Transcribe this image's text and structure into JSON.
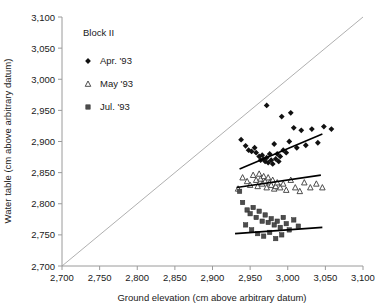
{
  "chart_data": {
    "type": "scatter",
    "title": "",
    "xlabel": "Ground elevation (cm above arbitrary datum)",
    "ylabel": "Water table (cm above arbitrary datum)",
    "xlim": [
      2700,
      3100
    ],
    "ylim": [
      2700,
      3100
    ],
    "xticks": [
      "2,700",
      "2,750",
      "2,800",
      "2,850",
      "2,900",
      "2,950",
      "3,000",
      "3,050",
      "3,100"
    ],
    "yticks": [
      "2,700",
      "2,750",
      "2,800",
      "2,850",
      "2,900",
      "2,950",
      "3,000",
      "3,050",
      "3,100"
    ],
    "xtick_values": [
      2700,
      2750,
      2800,
      2850,
      2900,
      2950,
      3000,
      3050,
      3100
    ],
    "ytick_values": [
      2700,
      2750,
      2800,
      2850,
      2900,
      2950,
      3000,
      3050,
      3100
    ],
    "grid": false,
    "legend_position": "upper-left-inside",
    "legend_title": "Block II",
    "reference_line": {
      "name": "1:1 line",
      "x": [
        2700,
        3100
      ],
      "y": [
        2700,
        3100
      ],
      "color": "#b0b0b0"
    },
    "series": [
      {
        "name": "Apr. '93",
        "marker": "diamond",
        "color": "#111111",
        "points": [
          [
            2938,
            2903
          ],
          [
            2944,
            2893
          ],
          [
            2948,
            2886
          ],
          [
            2952,
            2884
          ],
          [
            2956,
            2890
          ],
          [
            2958,
            2882
          ],
          [
            2962,
            2876
          ],
          [
            2964,
            2870
          ],
          [
            2966,
            2878
          ],
          [
            2968,
            2872
          ],
          [
            2970,
            2868
          ],
          [
            2972,
            2874
          ],
          [
            2974,
            2866
          ],
          [
            2976,
            2880
          ],
          [
            2978,
            2870
          ],
          [
            2980,
            2864
          ],
          [
            2982,
            2896
          ],
          [
            2984,
            2872
          ],
          [
            2986,
            2880
          ],
          [
            2988,
            2868
          ],
          [
            2990,
            2876
          ],
          [
            2992,
            2940
          ],
          [
            2994,
            2886
          ],
          [
            2998,
            2882
          ],
          [
            3002,
            2900
          ],
          [
            3008,
            2922
          ],
          [
            3012,
            2890
          ],
          [
            3018,
            2918
          ],
          [
            3024,
            2894
          ],
          [
            3032,
            2920
          ],
          [
            3040,
            2898
          ],
          [
            3048,
            2924
          ],
          [
            3058,
            2920
          ],
          [
            2972,
            2958
          ],
          [
            3004,
            2946
          ]
        ],
        "trend": {
          "x": [
            2936,
            3046
          ],
          "y": [
            2856,
            2912
          ]
        }
      },
      {
        "name": "May '93",
        "marker": "triangle",
        "color": "#3a3a3a",
        "points": [
          [
            2934,
            2824
          ],
          [
            2940,
            2842
          ],
          [
            2946,
            2836
          ],
          [
            2950,
            2830
          ],
          [
            2954,
            2846
          ],
          [
            2958,
            2838
          ],
          [
            2960,
            2828
          ],
          [
            2962,
            2848
          ],
          [
            2964,
            2840
          ],
          [
            2966,
            2832
          ],
          [
            2968,
            2844
          ],
          [
            2970,
            2836
          ],
          [
            2972,
            2826
          ],
          [
            2974,
            2842
          ],
          [
            2976,
            2834
          ],
          [
            2978,
            2830
          ],
          [
            2980,
            2838
          ],
          [
            2982,
            2824
          ],
          [
            2984,
            2828
          ],
          [
            2986,
            2834
          ],
          [
            2990,
            2826
          ],
          [
            2994,
            2832
          ],
          [
            2998,
            2822
          ],
          [
            3004,
            2838
          ],
          [
            3010,
            2826
          ],
          [
            3016,
            2820
          ],
          [
            3022,
            2834
          ],
          [
            3030,
            2826
          ],
          [
            3038,
            2832
          ],
          [
            3046,
            2826
          ]
        ],
        "trend": {
          "x": [
            2932,
            3044
          ],
          "y": [
            2826,
            2846
          ]
        }
      },
      {
        "name": "Jul. '93",
        "marker": "square",
        "color": "#4d4d4d",
        "points": [
          [
            2936,
            2820
          ],
          [
            2940,
            2802
          ],
          [
            2946,
            2790
          ],
          [
            2950,
            2784
          ],
          [
            2954,
            2794
          ],
          [
            2958,
            2778
          ],
          [
            2962,
            2788
          ],
          [
            2966,
            2772
          ],
          [
            2970,
            2782
          ],
          [
            2974,
            2770
          ],
          [
            2978,
            2776
          ],
          [
            2982,
            2766
          ],
          [
            2986,
            2772
          ],
          [
            2990,
            2762
          ],
          [
            2994,
            2778
          ],
          [
            2998,
            2768
          ],
          [
            3002,
            2758
          ],
          [
            3008,
            2774
          ],
          [
            3014,
            2764
          ],
          [
            2944,
            2766
          ],
          [
            2952,
            2758
          ],
          [
            2960,
            2752
          ],
          [
            2968,
            2748
          ],
          [
            2976,
            2754
          ],
          [
            2984,
            2744
          ],
          [
            2992,
            2750
          ]
        ],
        "trend": {
          "x": [
            2930,
            3046
          ],
          "y": [
            2752,
            2762
          ]
        }
      }
    ]
  },
  "axes": {
    "x_title": "Ground elevation (cm above arbitrary datum)",
    "y_title": "Water table (cm above arbitrary datum)"
  },
  "legend": {
    "title": "Block II",
    "entries": [
      {
        "label": "Apr. '93",
        "marker": "diamond-icon"
      },
      {
        "label": "May '93",
        "marker": "triangle-icon"
      },
      {
        "label": "Jul. '93",
        "marker": "square-icon"
      }
    ]
  }
}
